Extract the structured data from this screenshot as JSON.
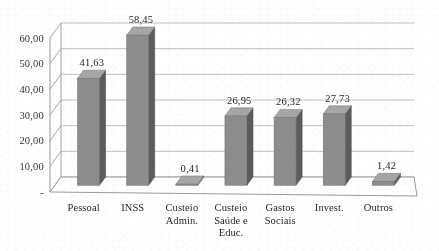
{
  "chart_data": {
    "type": "bar",
    "title": "",
    "subtitle": "",
    "xlabel": "",
    "ylabel": "",
    "categories": [
      "Pessoal",
      "INSS",
      "Custeio Admin.",
      "Custeio Saúde e Educ.",
      "Gastos Sociais",
      "Invest.",
      "Outros"
    ],
    "category_lines": [
      [
        "Pessoal"
      ],
      [
        "INSS"
      ],
      [
        "Custeio",
        "Admin."
      ],
      [
        "Custeio",
        "Saúde e",
        "Educ."
      ],
      [
        "Gastos",
        "Sociais"
      ],
      [
        "Invest."
      ],
      [
        "Outros"
      ]
    ],
    "values": [
      41.63,
      58.45,
      0.41,
      26.95,
      26.32,
      27.73,
      1.42
    ],
    "data_labels": [
      "41,63",
      "58,45",
      "0,41",
      "26,95",
      "26,32",
      "27,73",
      "1,42"
    ],
    "ylim": [
      0,
      60
    ],
    "ytick_values": [
      0,
      10,
      20,
      30,
      40,
      50,
      60
    ],
    "ytick_labels": [
      "-",
      "10,00",
      "20,00",
      "30,00",
      "40,00",
      "50,00",
      "60,00"
    ],
    "grid": true,
    "grid_axis": "y",
    "legend": false,
    "legend_position": "none",
    "three_d": true,
    "colors": {
      "bar_front": "#8d8d8d",
      "bar_side": "#5c5c5c",
      "bar_top": "#a6a6a6",
      "grid_line": "#b9b9b9",
      "wall_line": "#9a9a9a",
      "floor_fill": "#ffffff",
      "background": "#ffffff",
      "text": "#2b2b2b"
    }
  }
}
